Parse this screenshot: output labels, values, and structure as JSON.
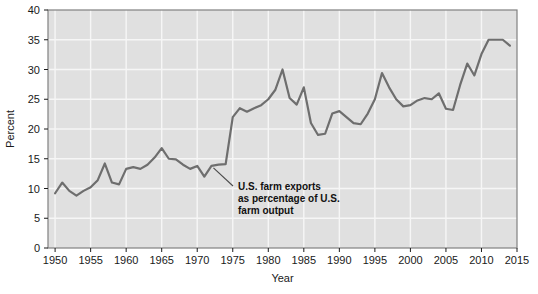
{
  "chart_data": {
    "type": "line",
    "title": "",
    "xlabel": "Year",
    "ylabel": "Percent",
    "xlim": [
      1949,
      2015
    ],
    "ylim": [
      0,
      40
    ],
    "ytick_values": [
      0,
      5,
      10,
      15,
      20,
      25,
      30,
      35,
      40
    ],
    "ytick_labels": [
      "0",
      "5",
      "10",
      "15",
      "20",
      "25",
      "30",
      "35",
      "40"
    ],
    "xtick_values": [
      1950,
      1955,
      1960,
      1965,
      1970,
      1975,
      1980,
      1985,
      1990,
      1995,
      2000,
      2005,
      2010,
      2015
    ],
    "xtick_labels": [
      "1950",
      "1955",
      "1960",
      "1965",
      "1970",
      "1975",
      "1980",
      "1985",
      "1990",
      "1995",
      "2000",
      "2005",
      "2010",
      "2015"
    ],
    "grid": true,
    "legend": "none",
    "series": [
      {
        "name": "U.S. farm exports as percentage of U.S. farm output",
        "color": "#6e6e6e",
        "x": [
          1950,
          1951,
          1952,
          1953,
          1954,
          1955,
          1956,
          1957,
          1958,
          1959,
          1960,
          1961,
          1962,
          1963,
          1964,
          1965,
          1966,
          1967,
          1968,
          1969,
          1970,
          1971,
          1972,
          1973,
          1974,
          1975,
          1976,
          1977,
          1978,
          1979,
          1980,
          1981,
          1982,
          1983,
          1984,
          1985,
          1986,
          1987,
          1988,
          1989,
          1990,
          1991,
          1992,
          1993,
          1994,
          1995,
          1996,
          1997,
          1998,
          1999,
          2000,
          2001,
          2002,
          2003,
          2004,
          2005,
          2006,
          2007,
          2008,
          2009,
          2010,
          2011,
          2012,
          2013,
          2014
        ],
        "y": [
          9.2,
          11.0,
          9.6,
          8.8,
          9.6,
          10.2,
          11.4,
          14.2,
          11.0,
          10.7,
          13.3,
          13.6,
          13.3,
          14.0,
          15.2,
          16.8,
          15.0,
          14.9,
          14.0,
          13.3,
          13.8,
          12.0,
          13.8,
          14.0,
          14.1,
          22.0,
          23.5,
          22.9,
          23.5,
          24.0,
          25.0,
          26.6,
          30.0,
          25.2,
          24.1,
          27.0,
          21.0,
          19.0,
          19.2,
          22.6,
          23.0,
          22.0,
          21.0,
          20.8,
          22.6,
          25.0,
          29.4,
          27.0,
          25.0,
          23.8,
          24.0,
          24.8,
          25.2,
          25.0,
          26.0,
          23.4,
          23.2,
          27.4,
          31.0,
          29.0,
          32.6,
          35.0,
          35.0,
          35.0,
          34.0
        ]
      }
    ],
    "annotations": [
      {
        "text_lines": [
          "U.S. farm exports",
          "as percentage of U.S.",
          "farm output"
        ],
        "point_x": 1972,
        "point_y": 13.8
      }
    ]
  },
  "style": {
    "plot_background": "#e0e0e0",
    "grid_color": "#f6f6f6",
    "line_color": "#6e6e6e",
    "border_color": "#808080",
    "text_color": "#1a1a1a"
  }
}
